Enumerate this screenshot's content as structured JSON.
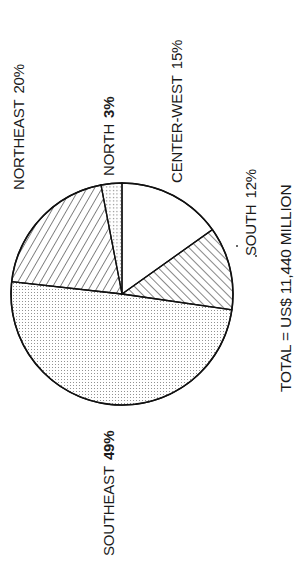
{
  "chart_data": {
    "type": "pie",
    "title": "",
    "orientation": "rotated -90 degrees (labels read bottom-to-top)",
    "categories": [
      "CENTER-WEST",
      "SOUTH",
      "SOUTHEAST",
      "NORTHEAST",
      "NORTH"
    ],
    "values": [
      15,
      12,
      49,
      20,
      3
    ],
    "unit": "%",
    "patterns": [
      "blank",
      "diagonal-hatch-forward",
      "fine-dots",
      "diagonal-hatch-back",
      "coarse-dots"
    ],
    "total_label": "TOTAL = US$ 11,440 MILLION",
    "start_angle_deg": -90,
    "direction": "clockwise",
    "legend": "none (direct labels)"
  },
  "labels": {
    "center_west": {
      "name": "CENTER-WEST",
      "pct": "15%"
    },
    "south": {
      "name": "SOUTH",
      "pct": "12%"
    },
    "southeast": {
      "name": "SOUTHEAST",
      "pct": "49%"
    },
    "northeast": {
      "name": "NORTHEAST",
      "pct": "20%"
    },
    "north": {
      "name": "NORTH",
      "pct": "3%"
    },
    "total": "TOTAL = US$ 11,440 MILLION"
  }
}
